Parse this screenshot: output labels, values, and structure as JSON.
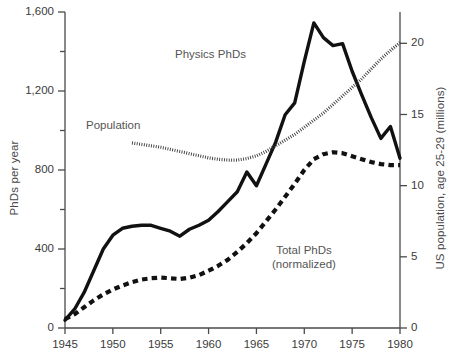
{
  "chart_data": {
    "type": "line",
    "title": "",
    "xlabel": "",
    "ylabel": "PhDs per year",
    "ylabel_right": "US population, age 25-29 (millions)",
    "xlim": [
      1945,
      1980
    ],
    "ylim": [
      0,
      1600
    ],
    "ylim_right": [
      0,
      22.2
    ],
    "grid": false,
    "legend_position": "inline-annotations",
    "xticks": [
      1945,
      1950,
      1955,
      1960,
      1965,
      1970,
      1975,
      1980
    ],
    "xtick_labels": [
      "1945",
      "1950",
      "1955",
      "1960",
      "1965",
      "1970",
      "1975",
      "1980"
    ],
    "yticks_left": [
      0,
      200,
      400,
      600,
      800,
      1000,
      1200,
      1400,
      1600
    ],
    "ytick_labels_left": [
      "0",
      "",
      "400",
      "",
      "800",
      "",
      "1,200",
      "",
      "1,600"
    ],
    "yticks_right": [
      0,
      5,
      10,
      15,
      20
    ],
    "ytick_labels_right": [
      "0",
      "5",
      "10",
      "15",
      "20"
    ],
    "series": [
      {
        "name": "Physics PhDs",
        "style": "solid",
        "axis": "left",
        "color": "#111111",
        "x": [
          1945,
          1946,
          1947,
          1948,
          1949,
          1950,
          1951,
          1952,
          1953,
          1954,
          1955,
          1956,
          1957,
          1958,
          1959,
          1960,
          1961,
          1962,
          1963,
          1964,
          1965,
          1966,
          1967,
          1968,
          1969,
          1970,
          1971,
          1972,
          1973,
          1974,
          1975,
          1976,
          1977,
          1978,
          1979,
          1980
        ],
        "values": [
          40,
          95,
          180,
          290,
          400,
          470,
          505,
          515,
          520,
          520,
          505,
          490,
          465,
          500,
          520,
          545,
          590,
          640,
          690,
          790,
          720,
          830,
          940,
          1080,
          1140,
          1350,
          1545,
          1470,
          1430,
          1440,
          1300,
          1180,
          1065,
          960,
          1020,
          860
        ]
      },
      {
        "name": "Total PhDs (normalized)",
        "style": "dashed",
        "axis": "left",
        "color": "#111111",
        "x": [
          1945,
          1946,
          1947,
          1948,
          1949,
          1950,
          1951,
          1952,
          1953,
          1954,
          1955,
          1956,
          1957,
          1958,
          1959,
          1960,
          1961,
          1962,
          1963,
          1964,
          1965,
          1966,
          1967,
          1968,
          1969,
          1970,
          1971,
          1972,
          1973,
          1974,
          1975,
          1976,
          1977,
          1978,
          1979,
          1980
        ],
        "values": [
          45,
          70,
          105,
          140,
          170,
          195,
          215,
          232,
          245,
          252,
          255,
          252,
          248,
          255,
          268,
          290,
          315,
          345,
          385,
          430,
          480,
          540,
          600,
          665,
          730,
          800,
          855,
          880,
          890,
          885,
          870,
          855,
          840,
          830,
          825,
          825
        ]
      },
      {
        "name": "Population",
        "style": "dotted",
        "axis": "right",
        "color": "#3a3a3a",
        "x": [
          1952,
          1953,
          1954,
          1955,
          1956,
          1957,
          1958,
          1959,
          1960,
          1961,
          1962,
          1963,
          1964,
          1965,
          1966,
          1967,
          1968,
          1969,
          1970,
          1971,
          1972,
          1973,
          1974,
          1975,
          1976,
          1977,
          1978,
          1979,
          1980
        ],
        "values": [
          13.0,
          12.9,
          12.8,
          12.7,
          12.55,
          12.4,
          12.25,
          12.1,
          11.95,
          11.85,
          11.8,
          11.8,
          11.9,
          12.1,
          12.4,
          12.8,
          13.2,
          13.6,
          14.1,
          14.6,
          15.1,
          15.7,
          16.3,
          16.9,
          17.5,
          18.2,
          18.9,
          19.5,
          20.05
        ]
      }
    ],
    "annotations": [
      {
        "text": "Physics PhDs",
        "x": 1962,
        "y": 1420
      },
      {
        "text": "Population",
        "x": 1950,
        "y": 1070
      },
      {
        "text": "Total PhDs",
        "x": 1972,
        "y": 440
      },
      {
        "text": "(normalized)",
        "x": 1972,
        "y": 370
      }
    ]
  },
  "labels": {
    "y_axis_left": "PhDs per year",
    "y_axis_right": "US population, age 25-29 (millions)",
    "physics": "Physics PhDs",
    "population": "Population",
    "total_line1": "Total PhDs",
    "total_line2": "(normalized)"
  }
}
